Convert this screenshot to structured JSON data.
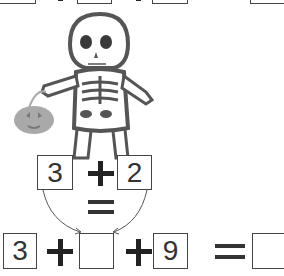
{
  "top_row": {
    "boxes": [
      "",
      "",
      "",
      ""
    ],
    "operators": [
      "+",
      "+",
      "="
    ]
  },
  "illustration": {
    "character": "skeleton",
    "prop": "jack-o-lantern bucket",
    "colors": {
      "outline": "#555555",
      "bones": "#ffffff",
      "eyes": "#3a3a3a",
      "pumpkin": "#a9a9a9"
    }
  },
  "hint": {
    "left": "3",
    "operator": "+",
    "right": "2",
    "result_operator": "="
  },
  "equation": {
    "a": "3",
    "op1": "+",
    "b": "",
    "op2": "+",
    "c": "9",
    "eq": "=",
    "answer": ""
  }
}
